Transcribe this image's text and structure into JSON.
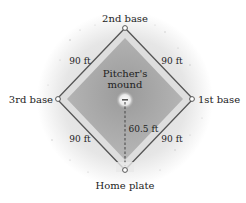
{
  "diagram": {
    "bases": {
      "second": "2nd base",
      "third": "3rd base",
      "first": "1st base",
      "home": "Home plate"
    },
    "mound_label_line1": "Pitcher's",
    "mound_label_line2": "mound",
    "distances": {
      "home_to_first": "90 ft",
      "first_to_second": "90 ft",
      "second_to_third": "90 ft",
      "third_to_home": "90 ft",
      "mound_to_home": "60.5 ft"
    },
    "colors": {
      "outfield_glow": "#e4e4e4",
      "infield_border": "#dcdcdc",
      "infield_fill_center": "#9c9c9c",
      "infield_fill_edge": "#b8b8b8",
      "base_path": "#555555",
      "base_marker_fill": "#ffffff",
      "text": "#222222"
    }
  }
}
